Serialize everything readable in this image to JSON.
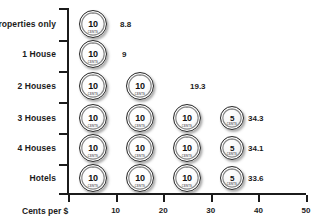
{
  "chart_data": {
    "type": "bar",
    "title": "",
    "subtitle": "",
    "xlabel": "Cents per $",
    "ylabel": "",
    "xlim": [
      0,
      50
    ],
    "grid": false,
    "legend": null,
    "categories": [
      "Properties only",
      "1 House",
      "2 Houses",
      "3 Houses",
      "4 Houses",
      "Hotels"
    ],
    "values": [
      8.8,
      9,
      19.3,
      34.3,
      34.1,
      33.6
    ],
    "value_labels": [
      "8.8",
      "9",
      "19.3",
      "34.3",
      "34.1",
      "33.6"
    ],
    "xticks": [
      10,
      20,
      30,
      40,
      50
    ],
    "xtick_labels": [
      "10",
      "20",
      "30",
      "40",
      "50"
    ],
    "units": "coin icons, each 10 or 5 cents",
    "icon_unit_text": "10",
    "icon_half_unit_text": "5",
    "coin_arc_text": "CENTS",
    "rows": [
      {
        "category": "Properties only",
        "value": 8.8,
        "label": "8.8",
        "coins": [
          "10"
        ]
      },
      {
        "category": "1 House",
        "value": 9,
        "label": "9",
        "coins": [
          "10"
        ]
      },
      {
        "category": "2 Houses",
        "value": 19.3,
        "label": "19.3",
        "coins": [
          "10",
          "10"
        ]
      },
      {
        "category": "3 Houses",
        "value": 34.3,
        "label": "34.3",
        "coins": [
          "10",
          "10",
          "10",
          "5"
        ]
      },
      {
        "category": "4 Houses",
        "value": 34.1,
        "label": "34.1",
        "coins": [
          "10",
          "10",
          "10",
          "5"
        ]
      },
      {
        "category": "Hotels",
        "value": 33.6,
        "label": "33.6",
        "coins": [
          "10",
          "10",
          "10",
          "5"
        ]
      }
    ]
  },
  "colors": {
    "axis": "#1b1b1b",
    "text": "#1b1b1b",
    "background": "#ffffff",
    "coin_outline": "#2a2a2a"
  }
}
